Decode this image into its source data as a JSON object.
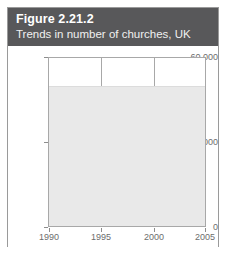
{
  "figure": {
    "number_label": "Figure 2.21.2",
    "subtitle": "Trends in number of churches, UK",
    "header_bg": "#58585a",
    "border_color": "#9a9a9a"
  },
  "chart_data": {
    "type": "area",
    "title": "Figure 2.21.2",
    "subtitle": "Trends in number of churches, UK",
    "xlabel": "",
    "ylabel": "",
    "x": [
      1990,
      1995,
      2000,
      2005
    ],
    "values": [
      50000,
      50000,
      50000,
      50000
    ],
    "series": [
      {
        "name": "Number of churches, UK",
        "values": [
          50000,
          50000,
          50000,
          50000
        ],
        "color": "#e9e9e9"
      }
    ],
    "xlim": [
      1990,
      2005
    ],
    "ylim": [
      0,
      60000
    ],
    "x_ticks": [
      1990,
      1995,
      2000,
      2005
    ],
    "x_tick_labels": [
      "1990",
      "1995",
      "2000",
      "2005"
    ],
    "y_ticks": [
      0,
      30000,
      60000
    ],
    "y_tick_labels": [
      "0",
      "30,000",
      "60,000"
    ],
    "grid": "vertical",
    "legend": "none",
    "fill_color": "#e9e9e9",
    "axis_color": "#a8a8a8",
    "tick_label_color": "#6d6d6d"
  },
  "axes": {
    "y_labels": [
      "60,000",
      "30,000",
      "0"
    ],
    "x_labels": [
      "1990",
      "1995",
      "2000",
      "2005"
    ]
  }
}
